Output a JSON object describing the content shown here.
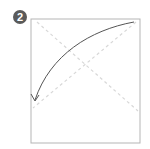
{
  "step": {
    "number": "2",
    "badge_color": "#5a5a5a"
  },
  "diagram": {
    "paper_color": "#ffffff",
    "outline_color": "#b5b5b5",
    "crease_color": "#d8d8d8",
    "arrow_color": "#555555",
    "square": {
      "x": 31,
      "y": 19,
      "w": 109,
      "h": 124
    },
    "creases": [
      "diagonal-top-left-to-bottom-right",
      "diagonal-top-right-to-bottom-left"
    ],
    "arrow": {
      "from": "top-right-corner",
      "to": "bottom-left-crease-end",
      "curve": "counterclockwise"
    }
  }
}
